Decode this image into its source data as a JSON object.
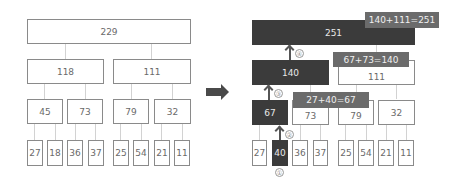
{
  "left_tree": {
    "root": "229",
    "level1": [
      "118",
      "111"
    ],
    "level2": [
      "45",
      "73",
      "79",
      "32"
    ],
    "leaves": [
      "27",
      "18",
      "36",
      "37",
      "25",
      "54",
      "21",
      "11"
    ]
  },
  "right_tree": {
    "root": "251",
    "level1": [
      "140",
      "111"
    ],
    "level2": [
      "67",
      "73",
      "79",
      "32"
    ],
    "leaves": [
      "27",
      "40",
      "36",
      "37",
      "25",
      "54",
      "21",
      "11"
    ]
  },
  "callouts": [
    "140+111=251",
    "67+73=140",
    "27+40=67"
  ],
  "steps": [
    "①",
    "②",
    "③",
    "④"
  ],
  "colors": {
    "highlight": "#3b3b3b",
    "callout": "#6b6b6b",
    "border": "#8a8a8a"
  }
}
